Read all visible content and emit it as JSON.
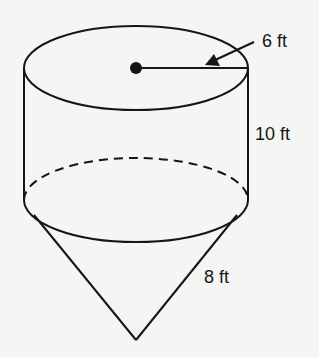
{
  "figure": {
    "type": "cylinder with cone below",
    "labels": {
      "radius": "6 ft",
      "height": "10 ft",
      "slant": "8 ft"
    }
  }
}
